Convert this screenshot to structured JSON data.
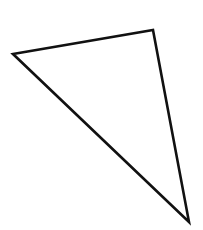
{
  "diagram": {
    "type": "triangle",
    "stroke_color": "#111111",
    "fill_color": "none",
    "stroke_width": 2.6,
    "vertices": [
      {
        "x": 13,
        "y": 54
      },
      {
        "x": 153,
        "y": 30
      },
      {
        "x": 189,
        "y": 222
      }
    ]
  }
}
